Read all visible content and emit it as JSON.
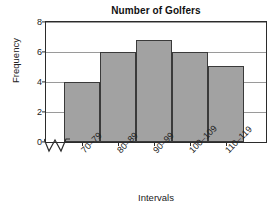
{
  "chart_data": {
    "type": "bar",
    "title": "Number of Golfers",
    "xlabel": "Intervals",
    "ylabel": "Frequency",
    "categories": [
      "70–79",
      "80–89",
      "90–99",
      "100–109",
      "110–119"
    ],
    "values": [
      4,
      6,
      6.8,
      6,
      5.1
    ],
    "ylim": [
      0,
      8
    ],
    "yticks": [
      0,
      2,
      4,
      6,
      8
    ],
    "grid": true,
    "legend": "none",
    "axis_break": "zigzag-on-x-axis-between-origin-and-first-bar",
    "bar_fill_color": "#a2a2a2",
    "bar_border_color": "#3a3a3a",
    "gridline_color": "#9a9a9a",
    "frame_color": "#2b2b2b",
    "background_color": "#ffffff"
  }
}
